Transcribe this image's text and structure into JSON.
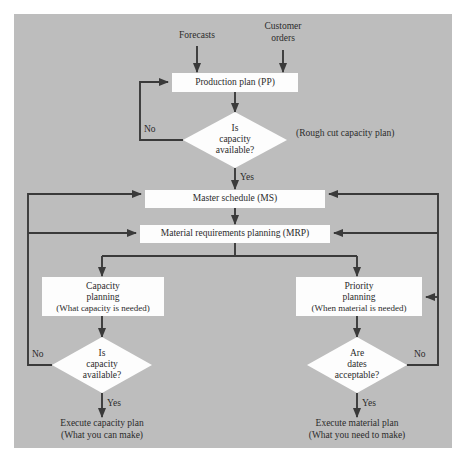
{
  "diagram": {
    "background_color": "#bdbdbd",
    "node_fill": "#fdfdfd",
    "line_color": "#3a3a3a"
  },
  "inputs": {
    "forecasts": "Forecasts",
    "customer_orders_line1": "Customer",
    "customer_orders_line2": "orders"
  },
  "nodes": {
    "production_plan": "Production plan (PP)",
    "master_schedule": "Master schedule (MS)",
    "mrp": "Material requirements planning (MRP)",
    "capacity_planning_line1": "Capacity",
    "capacity_planning_line2": "planning",
    "capacity_planning_line3": "(What capacity is needed)",
    "priority_planning_line1": "Priority",
    "priority_planning_line2": "planning",
    "priority_planning_line3": "(When material is needed)"
  },
  "decisions": {
    "rough_cut_line1": "Is",
    "rough_cut_line2": "capacity",
    "rough_cut_line3": "available?",
    "capacity_check_line1": "Is",
    "capacity_check_line2": "capacity",
    "capacity_check_line3": "available?",
    "dates_check_line1": "Are",
    "dates_check_line2": "dates",
    "dates_check_line3": "acceptable?"
  },
  "annotations": {
    "rough_cut_note": "(Rough cut capacity plan)"
  },
  "branch_labels": {
    "no_top": "No",
    "yes_top": "Yes",
    "no_left": "No",
    "yes_left": "Yes",
    "no_right": "No",
    "yes_right": "Yes"
  },
  "outputs": {
    "execute_capacity_line1": "Execute capacity plan",
    "execute_capacity_line2": "(What you can make)",
    "execute_material_line1": "Execute material plan",
    "execute_material_line2": "(What you need to make)"
  }
}
